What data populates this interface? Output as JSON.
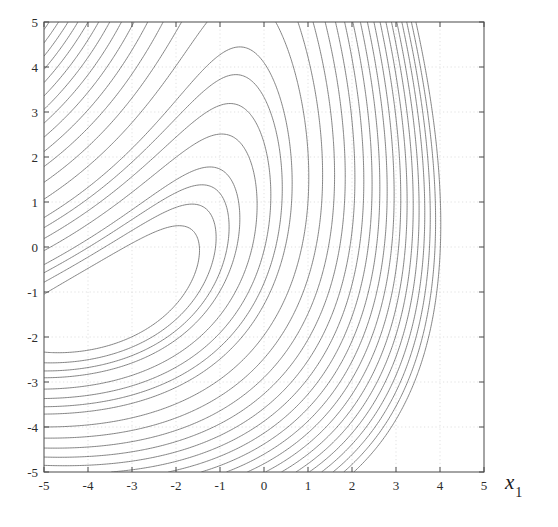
{
  "figure": {
    "background_color": "#ffffff",
    "axes_color": "#5a5a5a",
    "contour_color": "#6e6e6e",
    "grid_color": "#d8d8d8",
    "tick_text_color": "#2b2b2b"
  },
  "axis_label": {
    "x_symbol": "x",
    "x_subscript": "1"
  },
  "chart_data": {
    "type": "line",
    "plot_kind": "contour",
    "title": "",
    "subtitle": "",
    "xlabel": "x1",
    "ylabel": "",
    "xlim": [
      -5,
      5
    ],
    "ylim": [
      -5,
      5
    ],
    "grid": true,
    "grid_style": "dotted",
    "legend": "none",
    "x_ticks": [
      -5,
      -4,
      -3,
      -2,
      -1,
      0,
      1,
      2,
      3,
      4,
      5
    ],
    "x_tick_labels": [
      "-5",
      "-4",
      "-3",
      "-2",
      "-1",
      "0",
      "1",
      "2",
      "3",
      "4",
      "5"
    ],
    "y_ticks": [
      -5,
      -4,
      -3,
      -2,
      -1,
      0,
      1,
      2,
      3,
      4,
      5
    ],
    "y_tick_labels": [
      "-5",
      "-4",
      "-3",
      "-2",
      "-1",
      "0",
      "1",
      "2",
      "3",
      "4",
      "5"
    ],
    "minimum_location": [
      -2.1,
      -0.2
    ],
    "contour_count": 26,
    "contour_levels": [
      0.5,
      1,
      1.5,
      2,
      3,
      4,
      5,
      6,
      8,
      10,
      12,
      14,
      16,
      18,
      20,
      22,
      24,
      26,
      28,
      30,
      32,
      34,
      36,
      38,
      40,
      42
    ],
    "series": [
      {
        "name": "contour-innermost",
        "level": 0.5,
        "vertex_x": -2.1,
        "vertex_y": -0.2
      },
      {
        "name": "contour-second",
        "level": 1,
        "vertex_x": -3.6,
        "vertex_y": -1.55
      },
      {
        "name": "contour-third",
        "level": 2,
        "vertex_x": -4.6,
        "vertex_y": -2.6
      }
    ]
  }
}
